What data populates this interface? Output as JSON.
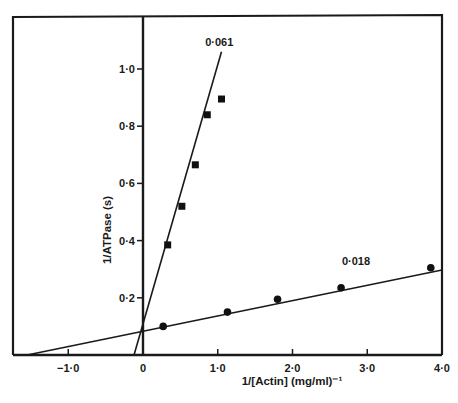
{
  "chart_data": {
    "type": "scatter",
    "title": "",
    "xlabel": "1/[Actin] (mg/ml)⁻¹",
    "ylabel": "1/ATPase (s)",
    "xlim": [
      -1.8,
      4.0
    ],
    "ylim": [
      0,
      1.15
    ],
    "x_ticks": [
      {
        "value": -1.0,
        "label": "−1·0"
      },
      {
        "value": 0,
        "label": "0"
      },
      {
        "value": 1.0,
        "label": "1·0"
      },
      {
        "value": 2.0,
        "label": "2·0"
      },
      {
        "value": 3.0,
        "label": "3·0"
      },
      {
        "value": 4.0,
        "label": "4·0"
      }
    ],
    "y_ticks": [
      {
        "value": 0.2,
        "label": "0·2"
      },
      {
        "value": 0.4,
        "label": "0·4"
      },
      {
        "value": 0.6,
        "label": "0·6"
      },
      {
        "value": 0.8,
        "label": "0·8"
      },
      {
        "value": 1.0,
        "label": "1·0"
      }
    ],
    "grid": false,
    "legend": null,
    "series": [
      {
        "name": "0·061",
        "marker": "square",
        "color": "#111111",
        "points": [
          [
            0.33,
            0.385
          ],
          [
            0.52,
            0.52
          ],
          [
            0.7,
            0.665
          ],
          [
            0.86,
            0.84
          ],
          [
            1.05,
            0.895
          ]
        ],
        "fit_line": {
          "x0": -0.12,
          "y0": 0.0,
          "x1": 1.05,
          "y1": 1.06
        },
        "slope_label": "0·061"
      },
      {
        "name": "0·018",
        "marker": "circle",
        "color": "#111111",
        "points": [
          [
            0.27,
            0.1
          ],
          [
            1.13,
            0.15
          ],
          [
            1.8,
            0.195
          ],
          [
            2.65,
            0.235
          ],
          [
            3.85,
            0.305
          ]
        ],
        "fit_line": {
          "x0": -1.55,
          "y0": 0.0,
          "x1": 4.0,
          "y1": 0.297
        },
        "slope_label": "0·018"
      }
    ],
    "annotations": [
      {
        "text": "0·061",
        "x": 1.02,
        "y": 1.08
      },
      {
        "text": "0·018",
        "x": 2.85,
        "y": 0.315
      }
    ]
  }
}
